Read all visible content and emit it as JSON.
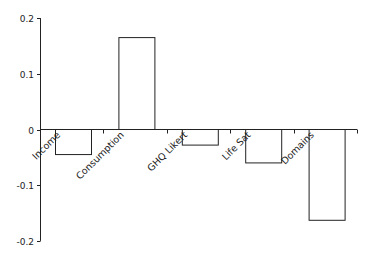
{
  "chart_data": {
    "type": "bar",
    "title": "",
    "xlabel": "",
    "ylabel": "",
    "categories": [
      "Income",
      "Consumption",
      "GHQ Likert",
      "Life Sat",
      "Domains"
    ],
    "values": [
      -0.045,
      0.165,
      -0.028,
      -0.06,
      -0.163
    ],
    "ylim": [
      -0.2,
      0.2
    ],
    "yticks": [
      0.2,
      0.1,
      0,
      -0.1,
      -0.2
    ],
    "ytick_labels": [
      "0.2",
      "0.1",
      "0",
      "-0.1",
      "-0.2"
    ],
    "grid": false,
    "legend": null,
    "bar_fill": "#ffffff",
    "bar_stroke": "#222222"
  }
}
